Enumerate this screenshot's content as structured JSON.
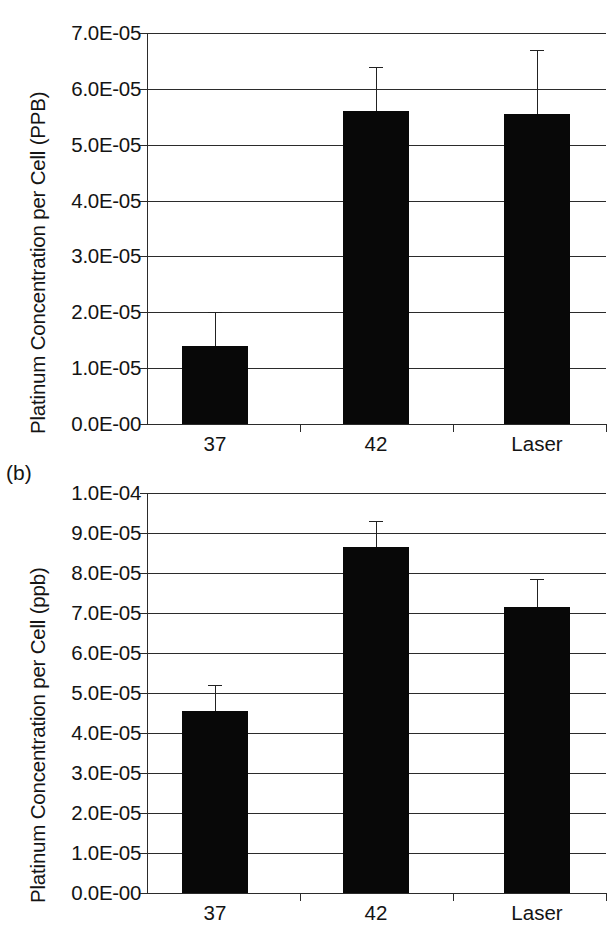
{
  "figure": {
    "panel_a_label": "",
    "panel_b_label": "(b)"
  },
  "chart_data": [
    {
      "id": "panel-a",
      "type": "bar",
      "title": "",
      "xlabel": "",
      "ylabel": "Platinum Concentration per Cell (PPB)",
      "categories": [
        "37",
        "42",
        "Laser"
      ],
      "values": [
        1.4e-05,
        5.6e-05,
        5.55e-05
      ],
      "errors_upper": [
        6e-06,
        8e-06,
        1.15e-05
      ],
      "ylim": [
        0.0,
        7e-05
      ],
      "yticks": [
        0.0,
        1e-05,
        2e-05,
        3e-05,
        4e-05,
        5e-05,
        6e-05,
        7e-05
      ],
      "ytick_labels": [
        "0.0E-00",
        "1.0E-05",
        "2.0E-05",
        "3.0E-05",
        "4.0E-05",
        "5.0E-05",
        "6.0E-05",
        "7.0E-05"
      ],
      "grid": true,
      "legend": "none",
      "bar_color": "#080808"
    },
    {
      "id": "panel-b",
      "type": "bar",
      "title": "",
      "xlabel": "",
      "ylabel": "Platinum Concentration per Cell (ppb)",
      "categories": [
        "37",
        "42",
        "Laser"
      ],
      "values": [
        4.55e-05,
        8.65e-05,
        7.15e-05
      ],
      "errors_upper": [
        6.5e-06,
        6.5e-06,
        7e-06
      ],
      "ylim": [
        0.0,
        0.0001
      ],
      "yticks": [
        0.0,
        1e-05,
        2e-05,
        3e-05,
        4e-05,
        5e-05,
        6e-05,
        7e-05,
        8e-05,
        9e-05,
        0.0001
      ],
      "ytick_labels": [
        "0.0E-00",
        "1.0E-05",
        "2.0E-05",
        "3.0E-05",
        "4.0E-05",
        "5.0E-05",
        "6.0E-05",
        "7.0E-05",
        "8.0E-05",
        "9.0E-05",
        "1.0E-04"
      ],
      "grid": true,
      "legend": "none",
      "bar_color": "#080808"
    }
  ],
  "layout": {
    "panels": [
      {
        "plot_left": 147,
        "plot_right": 606,
        "plot_top": 33,
        "plot_bottom": 424,
        "ytitle_left": 26,
        "ytitle_bottom": 434,
        "xlabel_y": 434,
        "bar_width": 66,
        "bar_centers": [
          215,
          376,
          537
        ]
      },
      {
        "plot_left": 147,
        "plot_right": 606,
        "plot_top": 493,
        "plot_bottom": 893,
        "ytitle_left": 26,
        "ytitle_bottom": 903,
        "xlabel_y": 903,
        "bar_width": 66,
        "bar_centers": [
          215,
          376,
          537
        ]
      }
    ]
  }
}
